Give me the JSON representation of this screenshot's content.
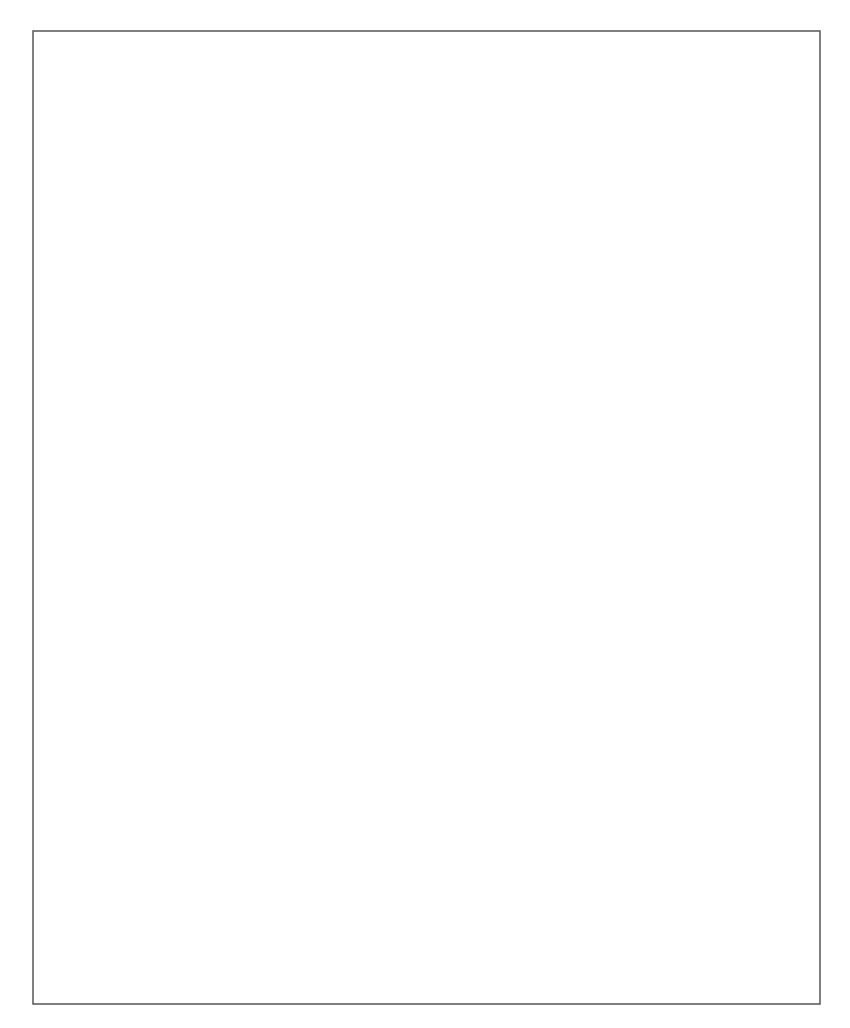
{
  "diagram": {
    "type": "flowchart",
    "nodes": {
      "start": {
        "kind": "terminal",
        "lines": [
          "Start"
        ]
      },
      "wins_query": {
        "kind": "process",
        "lines": [
          "WINS-Abfrage",
          "ausführen"
        ]
      },
      "wins_ok": {
        "kind": "decision",
        "lines": [
          "WINS",
          "erfolgreich?"
        ]
      },
      "done1": {
        "kind": "terminal",
        "lines": [
          "Fertig"
        ]
      },
      "broadcast": {
        "kind": "process",
        "lines": [
          "Drei Übertragungen",
          "durchführen"
        ]
      },
      "broadcast_ok": {
        "kind": "decision",
        "lines": [
          "Übertragung",
          "erfolgreich?"
        ]
      },
      "done2": {
        "kind": "terminal",
        "lines": [
          "Fertig"
        ]
      },
      "lmhosts_enabled": {
        "kind": "decision",
        "lines": [
          "LMHOSTS",
          "aktiviert?"
        ]
      },
      "lmhosts_lookup": {
        "kind": "process",
        "lines": [
          "Den Namen in",
          "LMHOSTS aufrufen"
        ]
      },
      "lmhosts_ok": {
        "kind": "decision",
        "lines": [
          "LMHOSTS",
          "erfolgreich?"
        ]
      },
      "done3": {
        "kind": "terminal",
        "lines": [
          ""
        ]
      },
      "use_dns": {
        "kind": "decision",
        "lines": [
          "Verwenden der DNS",
          "für Windows-Namens-",
          "auflösung"
        ]
      },
      "hosts_read": {
        "kind": "process",
        "lines": [
          "Den Namen in",
          "HOSTS einlesen"
        ]
      },
      "hosts_ok": {
        "kind": "decision",
        "lines": [
          "HOSTS",
          "erfolgreich?"
        ]
      },
      "done4": {
        "kind": "terminal",
        "lines": [
          "Fertig"
        ]
      },
      "dns_query": {
        "kind": "process",
        "lines": [
          "Abfang des NetBiOS-Namen",
          "mit dem an DNS angehängten",
          "Domänennamen und,",
          "falls mißlungen, Versuch mit",
          "dem NetBIOS-Namen",
          "selbst in DNS."
        ]
      },
      "dns_ok": {
        "kind": "decision",
        "lines": [
          "Erfolgreich?"
        ]
      },
      "done5": {
        "kind": "terminal",
        "lines": [
          "Fertig"
        ]
      },
      "retry": {
        "kind": "terminal",
        "lines": [
          "Wiederholung des ganzen",
          "Vorgangs und Fehlschlagens (es sei denn,",
          "es funktioniert plötzlich beim",
          "zweiten Mal )"
        ]
      }
    },
    "edges": [
      {
        "from": "start",
        "to": "wins_query",
        "label": ""
      },
      {
        "from": "wins_query",
        "to": "wins_ok",
        "label": ""
      },
      {
        "from": "wins_ok",
        "to": "done1",
        "label": "Ja"
      },
      {
        "from": "wins_ok",
        "to": "broadcast",
        "label": "Nein"
      },
      {
        "from": "broadcast",
        "to": "broadcast_ok",
        "label": ""
      },
      {
        "from": "broadcast_ok",
        "to": "done2",
        "label": "Ja"
      },
      {
        "from": "broadcast_ok",
        "to": "lmhosts_enabled",
        "label": "Nein"
      },
      {
        "from": "lmhosts_enabled",
        "to": "lmhosts_lookup",
        "label": "Ja"
      },
      {
        "from": "lmhosts_enabled",
        "to": "use_dns",
        "label": "Nein"
      },
      {
        "from": "lmhosts_lookup",
        "to": "lmhosts_ok",
        "label": ""
      },
      {
        "from": "lmhosts_ok",
        "to": "done3",
        "label": "Ja"
      },
      {
        "from": "lmhosts_ok",
        "to": "use_dns",
        "label": "Nein"
      },
      {
        "from": "use_dns",
        "to": "hosts_read",
        "label": "Ja"
      },
      {
        "from": "use_dns",
        "to": "retry",
        "label": "Nein"
      },
      {
        "from": "hosts_read",
        "to": "hosts_ok",
        "label": ""
      },
      {
        "from": "hosts_ok",
        "to": "done4",
        "label": "Ja"
      },
      {
        "from": "hosts_ok",
        "to": "dns_query",
        "label": "Nein"
      },
      {
        "from": "dns_query",
        "to": "dns_ok",
        "label": ""
      },
      {
        "from": "dns_ok",
        "to": "done5",
        "label": "Ja"
      },
      {
        "from": "dns_ok",
        "to": "retry",
        "label": "Nein"
      }
    ],
    "labels": {
      "yes": "Ja",
      "no": "Nein"
    }
  }
}
